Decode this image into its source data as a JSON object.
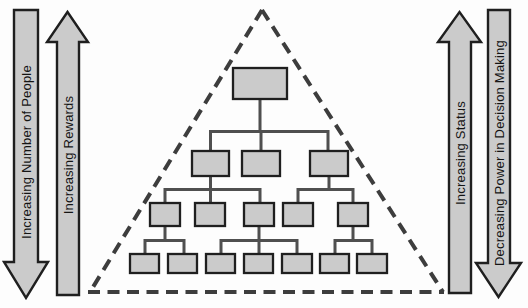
{
  "arrows": [
    {
      "id": "left-outer",
      "label": "Increasing Number of People",
      "direction": "down"
    },
    {
      "id": "left-inner",
      "label": "Increasing Rewards",
      "direction": "up"
    },
    {
      "id": "right-inner",
      "label": "Increasing Status",
      "direction": "up"
    },
    {
      "id": "right-outer",
      "label": "Decreasing Power in Decision Making",
      "direction": "down"
    }
  ],
  "pyramid": {
    "boundary": "dashed-triangle",
    "content": "organization-chart",
    "levels": [
      1,
      3,
      5,
      7
    ]
  },
  "colors": {
    "background": "#fdfdfd",
    "shape_fill": "#cbcbcb",
    "shape_border": "#1f1f1f",
    "connector": "#4f4f4f",
    "triangle_dash": "#3d3d3d",
    "text": "#141414"
  }
}
